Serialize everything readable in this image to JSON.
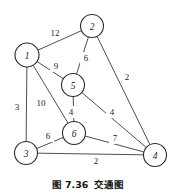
{
  "figure": {
    "caption_number": "图 7.36",
    "caption_title": "交通图",
    "colors": {
      "stroke": "#3a3a3a",
      "node_stroke": "#2b2b2b",
      "node_fill": "#ffffff",
      "text": "#1c1c1c",
      "background": "#ffffff"
    }
  },
  "chart_data": {
    "type": "diagram",
    "graph_kind": "undirected weighted graph",
    "nodes": [
      {
        "id": "1",
        "label": "1",
        "x": 27,
        "y": 55,
        "r": 12
      },
      {
        "id": "2",
        "label": "2",
        "x": 92,
        "y": 26,
        "r": 11.5
      },
      {
        "id": "3",
        "label": "3",
        "x": 26,
        "y": 153,
        "r": 11.5
      },
      {
        "id": "4",
        "label": "4",
        "x": 155,
        "y": 155,
        "r": 11.5
      },
      {
        "id": "5",
        "label": "5",
        "x": 73,
        "y": 85,
        "r": 11.5
      },
      {
        "id": "6",
        "label": "6",
        "x": 74,
        "y": 133,
        "r": 11.5
      }
    ],
    "edges": [
      {
        "from": "1",
        "to": "2",
        "weight": "12",
        "lx": 55,
        "ly": 33
      },
      {
        "from": "1",
        "to": "5",
        "weight": "9",
        "lx": 56,
        "ly": 66
      },
      {
        "from": "1",
        "to": "3",
        "weight": "3",
        "lx": 17,
        "ly": 107
      },
      {
        "from": "1",
        "to": "6",
        "weight": "10",
        "lx": 41,
        "ly": 103
      },
      {
        "from": "2",
        "to": "5",
        "weight": "6",
        "lx": 86,
        "ly": 58
      },
      {
        "from": "2",
        "to": "4",
        "weight": "2",
        "lx": 127,
        "ly": 77
      },
      {
        "from": "5",
        "to": "6",
        "weight": "4",
        "lx": 71,
        "ly": 112
      },
      {
        "from": "5",
        "to": "4",
        "weight": "4",
        "lx": 112,
        "ly": 112
      },
      {
        "from": "3",
        "to": "6",
        "weight": "6",
        "lx": 48,
        "ly": 136
      },
      {
        "from": "3",
        "to": "4",
        "weight": "2",
        "lx": 96,
        "ly": 161
      },
      {
        "from": "6",
        "to": "4",
        "weight": "7",
        "lx": 115,
        "ly": 138
      }
    ],
    "xlabel": "",
    "ylabel": "",
    "legend": []
  }
}
